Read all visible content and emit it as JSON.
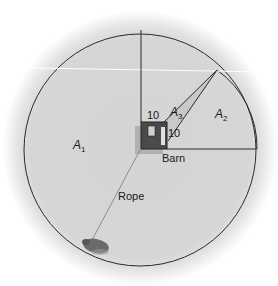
{
  "diagram": {
    "type": "geometry-figure",
    "labels": {
      "a1_main": "A",
      "a1_sub": "1",
      "a2_main": "A",
      "a2_sub": "2",
      "a3_main": "A",
      "a3_sub": "3",
      "barn_side_top": "10",
      "barn_side_right": "10",
      "barn": "Barn",
      "rope": "Rope"
    },
    "colors": {
      "background": "#ffffff",
      "disc_fill": "#d6d6d6",
      "line": "#2a2a2a",
      "barn_fill": "#4a4a4a",
      "barn_shadow": "#9a9a9a",
      "animal": "#5a5a5a",
      "rope": "#7a7a7a"
    }
  }
}
